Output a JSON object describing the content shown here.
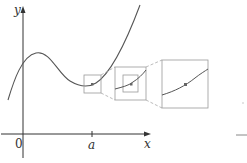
{
  "diagram": {
    "axes": {
      "y_label": "y",
      "x_label": "x",
      "origin_label": "0",
      "tick_label": "a"
    },
    "colors": {
      "axis": "#333333",
      "curve": "#555555",
      "box": "#9a9a9a",
      "dashed": "#aaaaaa",
      "point": "#666666"
    },
    "zoom_boxes": [
      {
        "level": 1,
        "description": "small box around point (a, f(a)) on curve"
      },
      {
        "level": 2,
        "description": "magnified view with nested box"
      },
      {
        "level": 3,
        "description": "further magnified view, curve appears nearly straight"
      }
    ]
  }
}
